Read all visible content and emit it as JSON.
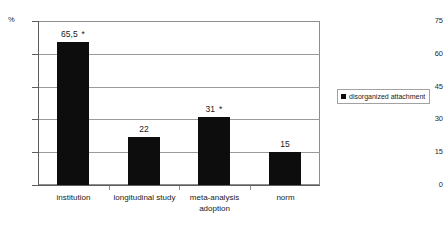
{
  "chart_data": {
    "type": "bar",
    "title": "",
    "subtitle": "",
    "xlabel": "",
    "ylabel": "%",
    "unit_label": "%",
    "categories": [
      "institution",
      "longitudinal study",
      "meta-analysis adoption",
      "norm"
    ],
    "category_lines": [
      [
        "institution"
      ],
      [
        "longitudinal study"
      ],
      [
        "meta-analysis",
        "adoption"
      ],
      [
        "norm"
      ]
    ],
    "values": [
      65.5,
      22,
      31,
      15
    ],
    "value_labels": [
      "65,5",
      "22",
      "31",
      "15"
    ],
    "significance_markers": [
      "*",
      "",
      "*",
      ""
    ],
    "series": [
      {
        "name": "disorganized attachment",
        "values": [
          65.5,
          22,
          31,
          15
        ],
        "color": "#0d0d0d"
      }
    ],
    "ylim": [
      0,
      75
    ],
    "yticks": [
      0,
      15,
      30,
      45,
      60,
      75
    ],
    "ytick_labels": [
      "0",
      "15",
      "30",
      "45",
      "60",
      "75"
    ],
    "grid": true,
    "grid_axis": "y",
    "legend": {
      "position": "right",
      "entries": [
        {
          "label": "disorganized attachment",
          "color": "#0d0d0d",
          "marker": "square"
        }
      ]
    },
    "colors": {
      "bar": "#0d0d0d",
      "grid": "#9a9a9a",
      "axis": "#5d5d5d",
      "frame": "#8d8d8d",
      "text": "#1a1a1a",
      "background": "#ffffff"
    }
  }
}
